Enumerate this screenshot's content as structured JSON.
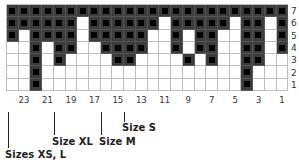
{
  "chart": {
    "columns": 24,
    "rows": 7,
    "colors": {
      "filled": "#3c3c3c",
      "stitch_dot": "#000000",
      "empty": "#ffffff",
      "gridline": "#bdbdbd"
    },
    "row_labels": [
      "7",
      "6",
      "5",
      "4",
      "3",
      "2",
      "1"
    ],
    "col_labels": [
      {
        "label": "23",
        "col": 23
      },
      {
        "label": "21",
        "col": 21
      },
      {
        "label": "19",
        "col": 19
      },
      {
        "label": "17",
        "col": 17
      },
      {
        "label": "15",
        "col": 15
      },
      {
        "label": "13",
        "col": 13
      },
      {
        "label": "11",
        "col": 11
      },
      {
        "label": "9",
        "col": 9
      },
      {
        "label": "7",
        "col": 7
      },
      {
        "label": "5",
        "col": 5
      },
      {
        "label": "3",
        "col": 3
      },
      {
        "label": "1",
        "col": 1
      }
    ],
    "grid_rows_top_to_bottom": [
      "111111111111111111111111",
      "111111011111101111101101",
      "101111011111001011001101",
      "001011001111001011001101",
      "001010000110000101001100",
      "001000000000000000001000",
      "001000000000000000001000"
    ]
  },
  "size_markers": [
    {
      "label": "Sizes XS, L",
      "col": 24
    },
    {
      "label": "Size XL",
      "col": 20
    },
    {
      "label": "Size M",
      "col": 16
    },
    {
      "label": "Size S",
      "col": 14
    }
  ]
}
